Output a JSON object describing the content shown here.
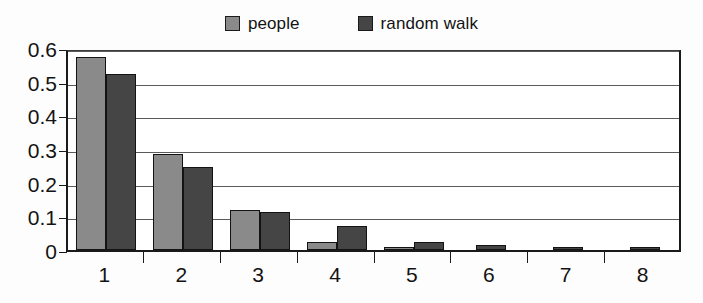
{
  "chart_data": {
    "type": "bar",
    "title": "",
    "subtitle": "",
    "xlabel": "",
    "ylabel": "",
    "categories": [
      "1",
      "2",
      "3",
      "4",
      "5",
      "6",
      "7",
      "8"
    ],
    "series": [
      {
        "name": "people",
        "color": "#8a8a8a",
        "values": [
          0.572,
          0.285,
          0.119,
          0.024,
          0.006,
          0,
          0,
          0
        ]
      },
      {
        "name": "random walk",
        "color": "#454545",
        "values": [
          0.522,
          0.246,
          0.112,
          0.07,
          0.023,
          0.014,
          0.004,
          0.004
        ]
      }
    ],
    "ylim": [
      0,
      0.6
    ],
    "y_ticks": [
      0,
      0.1,
      0.2,
      0.3,
      0.4,
      0.5,
      0.6
    ],
    "y_tick_labels": [
      "0",
      "0.1",
      "0.2",
      "0.3",
      "0.4",
      "0.5",
      "0.6"
    ],
    "x_tick_labels": [
      "1",
      "2",
      "3",
      "4",
      "5",
      "6",
      "7",
      "8"
    ],
    "grid": "horizontal",
    "legend_position": "top",
    "bar_border_color": "#131313",
    "axis_color": "#1a1a1a",
    "background_color": "#ffffff"
  },
  "legend": {
    "entries": [
      {
        "label": "people"
      },
      {
        "label": "random walk"
      }
    ]
  }
}
